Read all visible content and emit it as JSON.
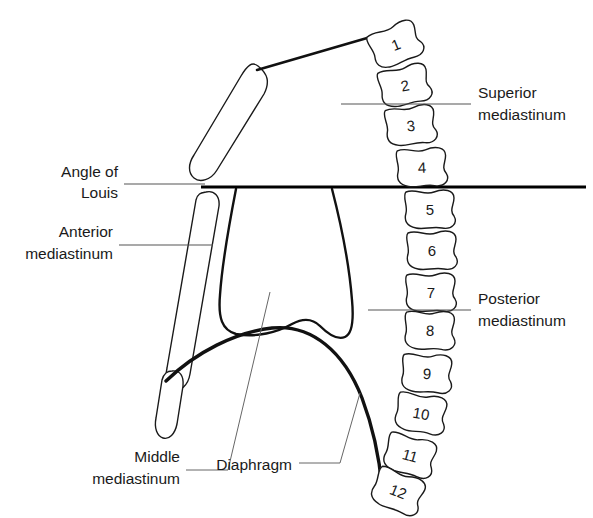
{
  "figure": {
    "background_color": "#ffffff",
    "ink_color": "#1a1a1a",
    "leader_color": "#555555"
  },
  "vertebrae": {
    "label_kind": "thoracic-vertebra-number",
    "items": [
      {
        "number": "1",
        "cx": 396,
        "cy": 45,
        "rot": -22
      },
      {
        "number": "2",
        "cx": 405,
        "cy": 86,
        "rot": -12
      },
      {
        "number": "3",
        "cx": 411,
        "cy": 126,
        "rot": -6
      },
      {
        "number": "4",
        "cx": 422,
        "cy": 168,
        "rot": -2
      },
      {
        "number": "5",
        "cx": 430,
        "cy": 210,
        "rot": 0
      },
      {
        "number": "6",
        "cx": 432,
        "cy": 251,
        "rot": 0
      },
      {
        "number": "7",
        "cx": 431,
        "cy": 293,
        "rot": 0
      },
      {
        "number": "8",
        "cx": 430,
        "cy": 331,
        "rot": 2
      },
      {
        "number": "9",
        "cx": 427,
        "cy": 374,
        "rot": 4
      },
      {
        "number": "10",
        "cx": 421,
        "cy": 414,
        "rot": 10
      },
      {
        "number": "11",
        "cx": 410,
        "cy": 456,
        "rot": 16
      },
      {
        "number": "12",
        "cx": 398,
        "cy": 492,
        "rot": 22
      }
    ]
  },
  "labels": {
    "superior_mediastinum": {
      "line1": "Superior",
      "line2": "mediastinum",
      "align": "left",
      "text_x": 478,
      "line1_y": 98,
      "line2_y": 120,
      "leader": {
        "x1": 341,
        "y1": 104,
        "x2": 471,
        "y2": 104
      }
    },
    "posterior_mediastinum": {
      "line1": "Posterior",
      "line2": "mediastinum",
      "align": "left",
      "text_x": 478,
      "line1_y": 304,
      "line2_y": 326,
      "leader": {
        "x1": 368,
        "y1": 310,
        "x2": 471,
        "y2": 310
      }
    },
    "angle_of_louis": {
      "line1": "Angle of",
      "line2": "Louis",
      "align": "right",
      "text_x": 118,
      "line1_y": 177,
      "line2_y": 198,
      "leader": {
        "x1": 124,
        "y1": 184,
        "x2": 205,
        "y2": 184
      }
    },
    "anterior_mediastinum": {
      "line1": "Anterior",
      "line2": "mediastinum",
      "align": "right",
      "text_x": 113,
      "line1_y": 237,
      "line2_y": 259,
      "leader": {
        "x1": 119,
        "y1": 245,
        "x2": 213,
        "y2": 245
      }
    },
    "middle_mediastinum": {
      "line1": "Middle",
      "line2": "mediastinum",
      "align": "right",
      "text_x": 180,
      "line1_y": 462,
      "line2_y": 484,
      "leader_path": "M 186 470 L 228 470 L 270 292"
    },
    "diaphragm": {
      "line1": "Diaphragm",
      "line2": "",
      "align": "right",
      "text_x": 292,
      "line1_y": 470,
      "line2_y": 470,
      "leader_path": "M 299 463 L 340 463 L 360 393"
    }
  },
  "structures": {
    "louis_line": {
      "name": "angle-of-louis-plane",
      "x1": 201,
      "y1": 187,
      "x2": 586,
      "y2": 187
    },
    "clavicle": {
      "name": "first-rib-clavicle",
      "path": "M 257 70 L 374 36"
    },
    "manubrium": {
      "name": "manubrium"
    },
    "sternum_body": {
      "name": "sternum-body"
    },
    "xiphoid": {
      "name": "xiphoid-process"
    },
    "heart": {
      "name": "heart-outline"
    },
    "diaphragm_arc": {
      "name": "diaphragm-arc"
    }
  }
}
